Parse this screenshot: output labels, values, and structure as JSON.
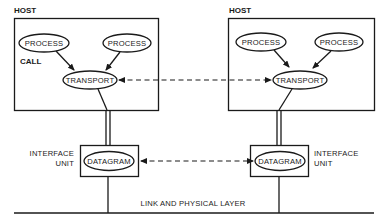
{
  "diagram": {
    "hosts": [
      {
        "label": "HOST",
        "processes": [
          {
            "label": "PROCESS"
          },
          {
            "label": "PROCESS"
          }
        ],
        "call_label": "CALL",
        "transport": {
          "label": "TRANSPORT"
        },
        "interface_unit": {
          "label_line1": "INTERFACE",
          "label_line2": "UNIT",
          "datagram": {
            "label": "DATAGRAM"
          }
        }
      },
      {
        "label": "HOST",
        "processes": [
          {
            "label": "PROCESS"
          },
          {
            "label": "PROCESS"
          }
        ],
        "transport": {
          "label": "TRANSPORT"
        },
        "interface_unit": {
          "label_line1": "INTERFACE",
          "label_line2": "UNIT",
          "datagram": {
            "label": "DATAGRAM"
          }
        }
      }
    ],
    "link_layer": {
      "label": "LINK AND PHYSICAL LAYER"
    },
    "connections": [
      {
        "from": "PROCESS",
        "to": "TRANSPORT",
        "style": "solid-arrow"
      },
      {
        "from": "TRANSPORT (left host)",
        "to": "TRANSPORT (right host)",
        "style": "dashed-bidirectional"
      },
      {
        "from": "TRANSPORT",
        "to": "DATAGRAM",
        "style": "double-line"
      },
      {
        "from": "DATAGRAM (left)",
        "to": "DATAGRAM (right)",
        "style": "dashed-bidirectional"
      },
      {
        "from": "DATAGRAM",
        "to": "LINK AND PHYSICAL LAYER",
        "style": "solid-line"
      }
    ]
  }
}
